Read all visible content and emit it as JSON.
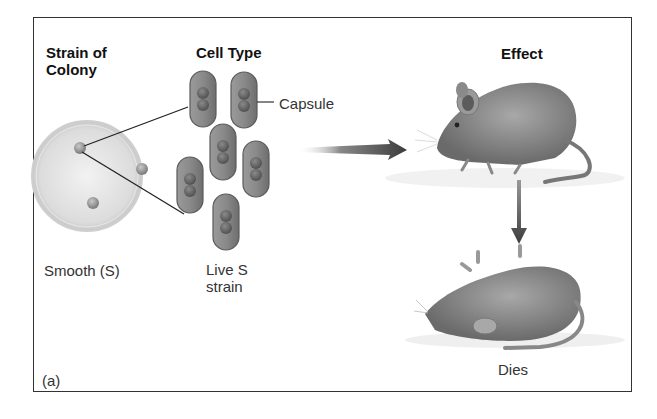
{
  "figure": {
    "panel_label": "(a)",
    "headings": {
      "strain": "Strain of\nColony",
      "strain_line1": "Strain of",
      "strain_line2": "Colony",
      "cell_type": "Cell Type",
      "effect": "Effect"
    },
    "labels": {
      "colony": "Smooth (S)",
      "cell_line1": "Live S",
      "cell_line2": "strain",
      "capsule": "Capsule",
      "outcome": "Dies"
    },
    "icons": [
      "petri-dish-icon",
      "bacterium-cell-icon",
      "arrow-right-icon",
      "mouse-alive-icon",
      "arrow-down-icon",
      "mouse-dead-icon"
    ],
    "colors": {
      "frame": "#333333",
      "cell_fill": "#8c8c8c",
      "cell_outline": "#5a5a5a",
      "arrow": "#444444",
      "dish": "#e2e2e2"
    }
  }
}
